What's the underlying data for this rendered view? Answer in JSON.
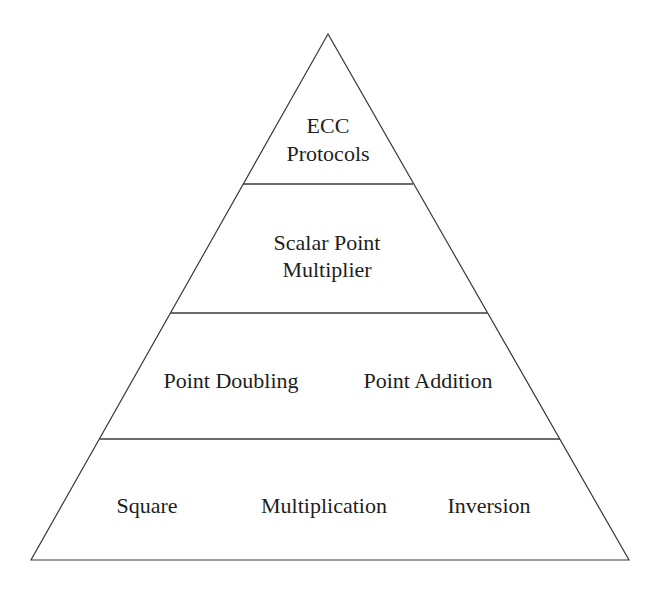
{
  "diagram": {
    "type": "pyramid",
    "colors": {
      "stroke": "#3a3a3a",
      "text": "#1e1e1e",
      "background": "#ffffff"
    },
    "tiers": [
      {
        "name": "ecc-protocols",
        "lines": [
          "ECC",
          "Protocols"
        ]
      },
      {
        "name": "scalar-point-multiplier",
        "lines": [
          "Scalar Point",
          "Multiplier"
        ]
      },
      {
        "name": "point-operations",
        "items": [
          "Point Doubling",
          "Point Addition"
        ]
      },
      {
        "name": "field-operations",
        "items": [
          "Square",
          "Multiplication",
          "Inversion"
        ]
      }
    ]
  }
}
